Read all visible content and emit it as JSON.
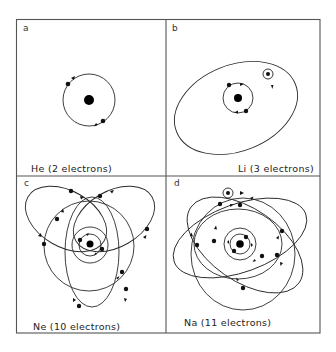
{
  "figure": {
    "colors": {
      "ink": "#111111",
      "frame": "#555555",
      "background": "#ffffff"
    },
    "panels": [
      {
        "id": "a",
        "letter": "a",
        "caption": "He (2 electrons)",
        "element": "He",
        "electrons": 2
      },
      {
        "id": "b",
        "letter": "b",
        "caption": "Li (3 electrons)",
        "element": "Li",
        "electrons": 3
      },
      {
        "id": "c",
        "letter": "c",
        "caption": "Ne (10 electrons)",
        "element": "Ne",
        "electrons": 10
      },
      {
        "id": "d",
        "letter": "d",
        "caption": "Na (11 electrons)",
        "element": "Na",
        "electrons": 11
      }
    ]
  }
}
